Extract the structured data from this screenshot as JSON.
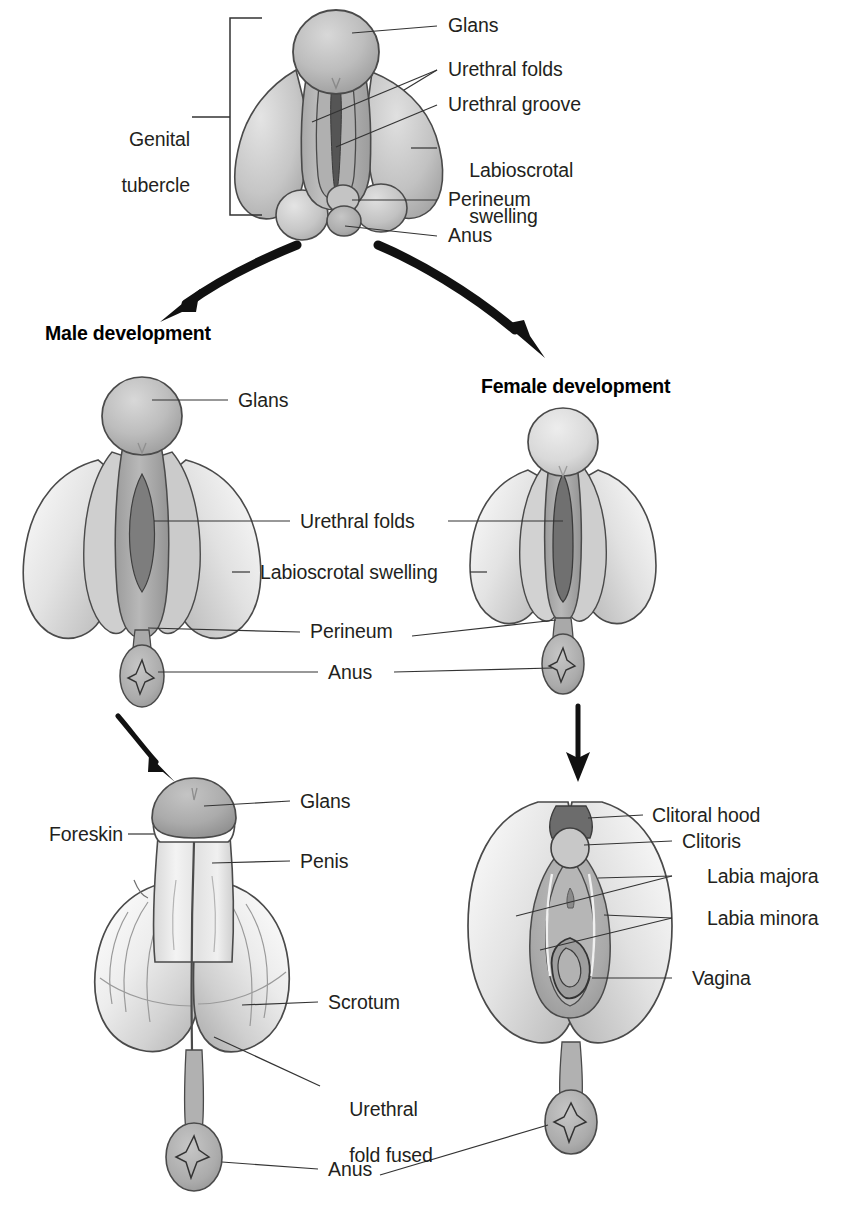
{
  "figure": {
    "background_color": "#ffffff",
    "text_color": "#231f20",
    "tissue_light": "#e2e2e2",
    "tissue_mid": "#c9c9c9",
    "tissue_dark": "#a6a6a6",
    "tissue_darkest": "#8a8a8a",
    "outline_color": "#3a3a3a",
    "arrow_color": "#111111"
  },
  "headings": {
    "male": "Male development",
    "female": "Female development"
  },
  "stage_indifferent": {
    "bracket_label": "Genital tubercle",
    "bracket_label_line1": "Genital",
    "bracket_label_line2": "tubercle",
    "labels": [
      {
        "id": "glans",
        "text": "Glans"
      },
      {
        "id": "urethral-folds",
        "text": "Urethral folds"
      },
      {
        "id": "urethral-groove",
        "text": "Urethral groove"
      },
      {
        "id": "labioscrotal-swelling-l1",
        "text": "Labioscrotal"
      },
      {
        "id": "labioscrotal-swelling-l2",
        "text": "swelling"
      },
      {
        "id": "perineum",
        "text": "Perineum"
      },
      {
        "id": "anus",
        "text": "Anus"
      }
    ]
  },
  "stage_differentiating": {
    "labels": [
      {
        "id": "glans",
        "text": "Glans"
      },
      {
        "id": "urethral-folds",
        "text": "Urethral folds"
      },
      {
        "id": "labioscrotal-swelling",
        "text": "Labioscrotal swelling"
      },
      {
        "id": "perineum",
        "text": "Perineum"
      },
      {
        "id": "anus",
        "text": "Anus"
      }
    ]
  },
  "stage_mature_male": {
    "labels": [
      {
        "id": "glans",
        "text": "Glans"
      },
      {
        "id": "foreskin",
        "text": "Foreskin"
      },
      {
        "id": "penis",
        "text": "Penis"
      },
      {
        "id": "scrotum",
        "text": "Scrotum"
      },
      {
        "id": "urethral-fold-fused-l1",
        "text": "Urethral"
      },
      {
        "id": "urethral-fold-fused-l2",
        "text": "fold fused"
      },
      {
        "id": "anus",
        "text": "Anus"
      }
    ]
  },
  "stage_mature_female": {
    "labels": [
      {
        "id": "clitoral-hood",
        "text": "Clitoral hood"
      },
      {
        "id": "clitoris",
        "text": "Clitoris"
      },
      {
        "id": "labia-majora",
        "text": "Labia majora"
      },
      {
        "id": "labia-minora",
        "text": "Labia minora"
      },
      {
        "id": "vagina",
        "text": "Vagina"
      }
    ]
  }
}
